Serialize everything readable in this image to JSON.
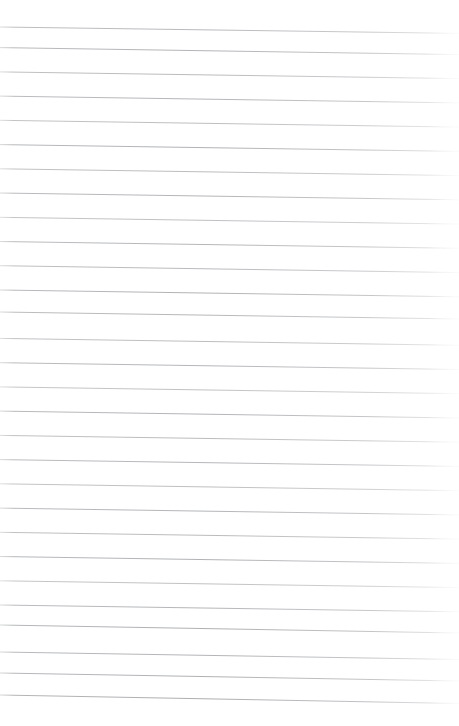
{
  "document": {
    "kind": "scanned-ruled-paper",
    "title": "Blank Ruled Notebook Page",
    "description": "A scan of an empty lined notebook sheet with no handwriting or printed text.",
    "page_width": 459,
    "page_height": 726,
    "background_color": "#ffffff",
    "has_text_content": false,
    "visible_text": "",
    "margin_rule": false,
    "holes_punched": false
  },
  "ruling": {
    "line_count": 29,
    "first_line_y_left": 27,
    "line_spacing": 24.2,
    "stroke_color": "#b0b2b6",
    "stroke_color_faint": "#d7d9dc",
    "stroke_width": 1,
    "skew_drop_px": 7,
    "left_edge_x": 0,
    "right_edge_x": 459,
    "fade_start_x": 430,
    "lines": [
      {
        "index": 1,
        "y_left": 27.0,
        "y_right": 33.4,
        "opacity": 0.8
      },
      {
        "index": 2,
        "y_left": 47.6,
        "y_right": 54.6,
        "opacity": 0.86
      },
      {
        "index": 3,
        "y_left": 71.9,
        "y_right": 78.6,
        "opacity": 0.78
      },
      {
        "index": 4,
        "y_left": 96.1,
        "y_right": 102.9,
        "opacity": 0.84
      },
      {
        "index": 5,
        "y_left": 120.3,
        "y_right": 127.1,
        "opacity": 0.74
      },
      {
        "index": 6,
        "y_left": 144.6,
        "y_right": 151.4,
        "opacity": 0.88
      },
      {
        "index": 7,
        "y_left": 168.8,
        "y_right": 175.6,
        "opacity": 0.76
      },
      {
        "index": 8,
        "y_left": 193.0,
        "y_right": 199.8,
        "opacity": 0.85
      },
      {
        "index": 9,
        "y_left": 217.3,
        "y_right": 224.1,
        "opacity": 0.72
      },
      {
        "index": 10,
        "y_left": 241.5,
        "y_right": 248.3,
        "opacity": 0.83
      },
      {
        "index": 11,
        "y_left": 265.7,
        "y_right": 272.6,
        "opacity": 0.79
      },
      {
        "index": 12,
        "y_left": 290.0,
        "y_right": 296.8,
        "opacity": 0.87
      },
      {
        "index": 13,
        "y_left": 312.0,
        "y_right": 319.0,
        "opacity": 0.82
      },
      {
        "index": 14,
        "y_left": 338.4,
        "y_right": 345.3,
        "opacity": 0.75
      },
      {
        "index": 15,
        "y_left": 362.7,
        "y_right": 369.5,
        "opacity": 0.84
      },
      {
        "index": 16,
        "y_left": 386.9,
        "y_right": 393.7,
        "opacity": 0.7
      },
      {
        "index": 17,
        "y_left": 411.1,
        "y_right": 418.0,
        "opacity": 0.86
      },
      {
        "index": 18,
        "y_left": 435.4,
        "y_right": 442.2,
        "opacity": 0.77
      },
      {
        "index": 19,
        "y_left": 459.6,
        "y_right": 466.4,
        "opacity": 0.83
      },
      {
        "index": 20,
        "y_left": 483.8,
        "y_right": 490.7,
        "opacity": 0.73
      },
      {
        "index": 21,
        "y_left": 508.1,
        "y_right": 514.9,
        "opacity": 0.85
      },
      {
        "index": 22,
        "y_left": 532.3,
        "y_right": 539.1,
        "opacity": 0.78
      },
      {
        "index": 23,
        "y_left": 556.5,
        "y_right": 563.4,
        "opacity": 0.88
      },
      {
        "index": 24,
        "y_left": 580.8,
        "y_right": 587.6,
        "opacity": 0.71
      },
      {
        "index": 25,
        "y_left": 605.0,
        "y_right": 611.8,
        "opacity": 0.84
      },
      {
        "index": 26,
        "y_left": 625.0,
        "y_right": 633.0,
        "opacity": 0.9
      },
      {
        "index": 27,
        "y_left": 652.0,
        "y_right": 659.5,
        "opacity": 0.86
      },
      {
        "index": 28,
        "y_left": 673.0,
        "y_right": 681.0,
        "opacity": 0.89
      },
      {
        "index": 29,
        "y_left": 695.0,
        "y_right": 703.5,
        "opacity": 0.92
      }
    ]
  }
}
